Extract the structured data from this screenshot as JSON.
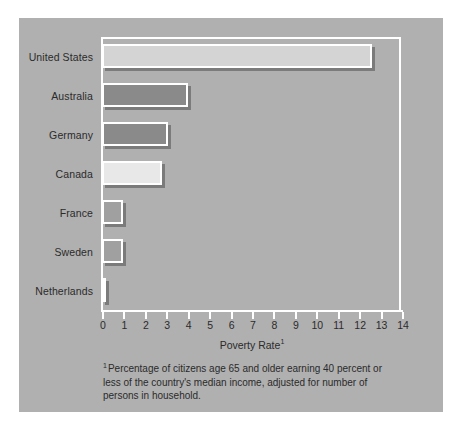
{
  "figure": {
    "background_color": "#b0b0b0",
    "frame_color": "#ffffff"
  },
  "chart_data": {
    "type": "bar",
    "orientation": "horizontal",
    "title": "",
    "xlabel": "Poverty Rate",
    "xlabel_superscript": "1",
    "ylabel": "",
    "xlim": [
      0,
      14
    ],
    "grid": false,
    "legend": "none",
    "categories": [
      "United States",
      "Australia",
      "Germany",
      "Canada",
      "France",
      "Sweden",
      "Netherlands"
    ],
    "values": [
      12.6,
      4.0,
      3.1,
      2.8,
      1.0,
      1.0,
      0.05
    ],
    "bar_colors": [
      "#d4d4d4",
      "#8a8a8a",
      "#8a8a8a",
      "#e8e8e8",
      "#a0a0a0",
      "#a0a0a0",
      "#b0b0b0"
    ],
    "xticks": [
      0,
      1,
      2,
      3,
      4,
      5,
      6,
      7,
      8,
      9,
      10,
      11,
      12,
      13,
      14
    ],
    "xtick_labels": [
      "0",
      "1",
      "2",
      "3",
      "4",
      "5",
      "6",
      "7",
      "8",
      "9",
      "10",
      "11",
      "12",
      "13",
      "14"
    ],
    "footnote_marker": "1",
    "footnote": "Percentage of citizens age 65 and older earning 40 percent or less of the country's median income, adjusted for number of persons in household."
  }
}
